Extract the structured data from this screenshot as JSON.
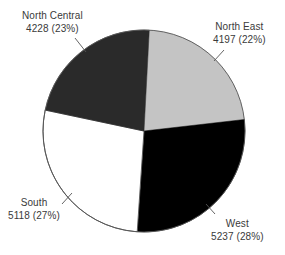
{
  "chart_data": {
    "type": "pie",
    "title": "",
    "subtitle": "",
    "xlabel": "",
    "ylabel": "",
    "legend_position": "none",
    "grid": false,
    "total": 18780,
    "categories": [
      "North East",
      "West",
      "South",
      "North Central"
    ],
    "values": [
      4197,
      5237,
      5118,
      4228
    ],
    "percentages": [
      22,
      28,
      27,
      23
    ],
    "slice_colors": [
      "#c4c4c4",
      "#000000",
      "#ffffff",
      "#2a2a2a"
    ],
    "slices": [
      {
        "label": "North East",
        "value": 4197,
        "percent": 28,
        "percent_label": "22%",
        "value_text": "4197 (22%)",
        "color": "#c4c4c4",
        "start_angle": 3,
        "end_angle": 82
      },
      {
        "label": "West",
        "value": 5237,
        "percent": 28,
        "percent_label": "28%",
        "value_text": "5237 (28%)",
        "color": "#000000",
        "start_angle": 82,
        "end_angle": 183
      },
      {
        "label": "South",
        "value": 5118,
        "percent": 27,
        "percent_label": "27%",
        "value_text": "5118 (27%)",
        "color": "#ffffff",
        "start_angle": 183,
        "end_angle": 280
      },
      {
        "label": "North Central",
        "value": 4228,
        "percent": 23,
        "percent_label": "23%",
        "value_text": "4228 (23%)",
        "color": "#2a2a2a",
        "start_angle": 280,
        "end_angle": 363
      }
    ]
  },
  "labels": {
    "north_central": {
      "name": "North Central",
      "value": "4228 (23%)"
    },
    "north_east": {
      "name": "North East",
      "value": "4197 (22%)"
    },
    "south": {
      "name": "South",
      "value": "5118 (27%)"
    },
    "west": {
      "name": "West",
      "value": "5237 (28%)"
    }
  },
  "style": {
    "background": "#ffffff",
    "text_color": "#3a3a3a",
    "outline_color": "#555555",
    "leader_color": "#555555"
  }
}
